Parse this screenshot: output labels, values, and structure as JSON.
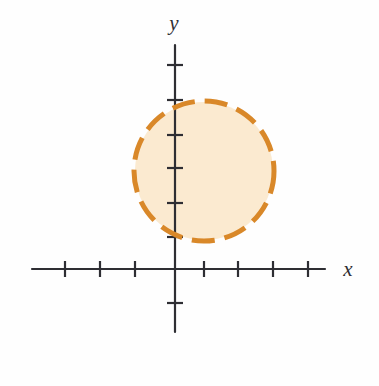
{
  "figure": {
    "title": "",
    "background_color": "#fefefe",
    "width": 379,
    "height": 386
  },
  "axes": {
    "x_axis": {
      "label": "x",
      "name": "x-axis",
      "color": "#2e2e33",
      "y_pixel": 269,
      "x_start": 32,
      "x_end": 325,
      "label_x": 348,
      "label_y": 276
    },
    "y_axis": {
      "label": "y",
      "name": "y-axis",
      "color": "#2e2e33",
      "x_pixel": 175,
      "y_start": 45,
      "y_end": 332,
      "label_x": 174,
      "label_y": 30
    },
    "tick_color": "#2e2e33",
    "tick_half_length": 8,
    "x_ticks": [
      65,
      100,
      135,
      204,
      238,
      273,
      308
    ],
    "y_ticks": [
      65,
      100,
      135,
      168,
      203,
      237,
      303
    ],
    "tick_labels_visible": false
  },
  "chart_data": {
    "type": "scatter",
    "plot_kind": "circle-region",
    "title": "",
    "xlabel": "x",
    "ylabel": "y",
    "grid": false,
    "legend": null,
    "tick_labels": [],
    "origin_pixel": {
      "x": 175,
      "y": 269
    },
    "pixels_per_unit": 34.5,
    "xlim": [
      -4.2,
      4.3
    ],
    "ylim": [
      -1.0,
      6.5
    ],
    "shapes": [
      {
        "name": "dashed-circle",
        "type": "circle",
        "center": {
          "x": 0.85,
          "y": 2.85
        },
        "radius": 2.03,
        "center_pixel": {
          "x": 204,
          "y": 171
        },
        "radius_pixel": 70,
        "stroke_color": "#d98829",
        "stroke_width": 5,
        "stroke_style": "dashed",
        "dash_length": 23,
        "dash_gap": 10,
        "fill_color": "#fbead0",
        "fill_opacity": 1
      }
    ]
  },
  "colors": {
    "curve_orange": "#d98829",
    "region_fill": "#fbead0",
    "axis_black": "#2e2e33",
    "page_background": "#fefefe"
  }
}
